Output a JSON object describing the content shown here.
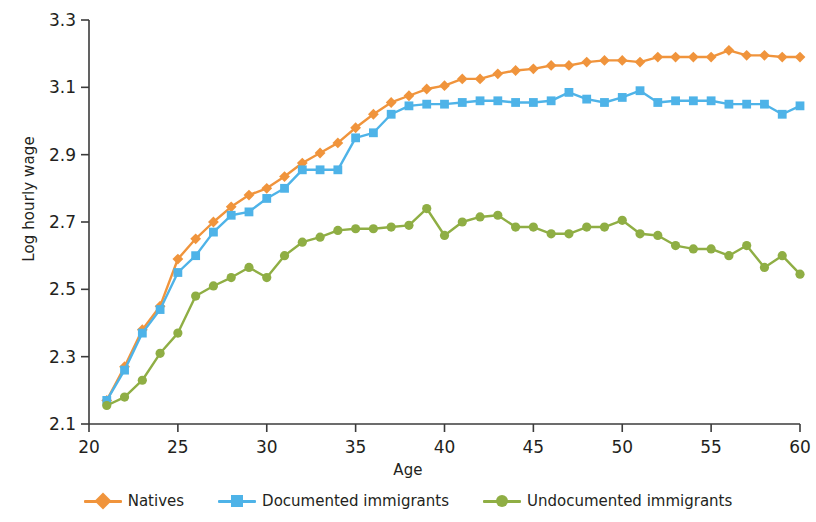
{
  "chart_data": {
    "type": "line",
    "title": "",
    "xlabel": "Age",
    "ylabel": "Log hourly wage",
    "xlim": [
      20,
      60
    ],
    "ylim": [
      2.1,
      3.3
    ],
    "xticks": [
      20,
      25,
      30,
      35,
      40,
      45,
      50,
      55,
      60
    ],
    "yticks": [
      2.1,
      2.3,
      2.5,
      2.7,
      2.9,
      3.1,
      3.3
    ],
    "grid": false,
    "legend_position": "bottom",
    "x": [
      21,
      22,
      23,
      24,
      25,
      26,
      27,
      28,
      29,
      30,
      31,
      32,
      33,
      34,
      35,
      36,
      37,
      38,
      39,
      40,
      41,
      42,
      43,
      44,
      45,
      46,
      47,
      48,
      49,
      50,
      51,
      52,
      53,
      54,
      55,
      56,
      57,
      58,
      59,
      60
    ],
    "series": [
      {
        "name": "Natives",
        "color": "#F0943C",
        "marker": "diamond",
        "values": [
          2.17,
          2.27,
          2.38,
          2.45,
          2.59,
          2.65,
          2.7,
          2.745,
          2.78,
          2.8,
          2.835,
          2.875,
          2.905,
          2.935,
          2.98,
          3.02,
          3.055,
          3.075,
          3.095,
          3.105,
          3.125,
          3.125,
          3.14,
          3.15,
          3.155,
          3.165,
          3.165,
          3.175,
          3.18,
          3.18,
          3.175,
          3.19,
          3.19,
          3.19,
          3.19,
          3.21,
          3.195,
          3.195,
          3.19,
          3.19
        ]
      },
      {
        "name": "Documented immigrants",
        "color": "#4EB3E8",
        "marker": "square",
        "values": [
          2.17,
          2.26,
          2.37,
          2.44,
          2.55,
          2.6,
          2.67,
          2.72,
          2.73,
          2.77,
          2.8,
          2.855,
          2.855,
          2.855,
          2.95,
          2.965,
          3.02,
          3.045,
          3.05,
          3.05,
          3.055,
          3.06,
          3.06,
          3.055,
          3.055,
          3.06,
          3.085,
          3.065,
          3.055,
          3.07,
          3.09,
          3.055,
          3.06,
          3.06,
          3.06,
          3.05,
          3.05,
          3.05,
          3.02,
          3.045
        ]
      },
      {
        "name": "Undocumented immigrants",
        "color": "#8FAE44",
        "marker": "circle",
        "values": [
          2.155,
          2.18,
          2.23,
          2.31,
          2.37,
          2.48,
          2.51,
          2.535,
          2.565,
          2.535,
          2.6,
          2.64,
          2.655,
          2.675,
          2.68,
          2.68,
          2.685,
          2.69,
          2.74,
          2.66,
          2.7,
          2.715,
          2.72,
          2.685,
          2.685,
          2.665,
          2.665,
          2.685,
          2.685,
          2.705,
          2.665,
          2.66,
          2.63,
          2.62,
          2.62,
          2.6,
          2.63,
          2.565,
          2.6,
          2.545
        ]
      }
    ]
  },
  "legend": {
    "items": [
      {
        "label": "Natives"
      },
      {
        "label": "Documented immigrants"
      },
      {
        "label": "Undocumented immigrants"
      }
    ]
  }
}
